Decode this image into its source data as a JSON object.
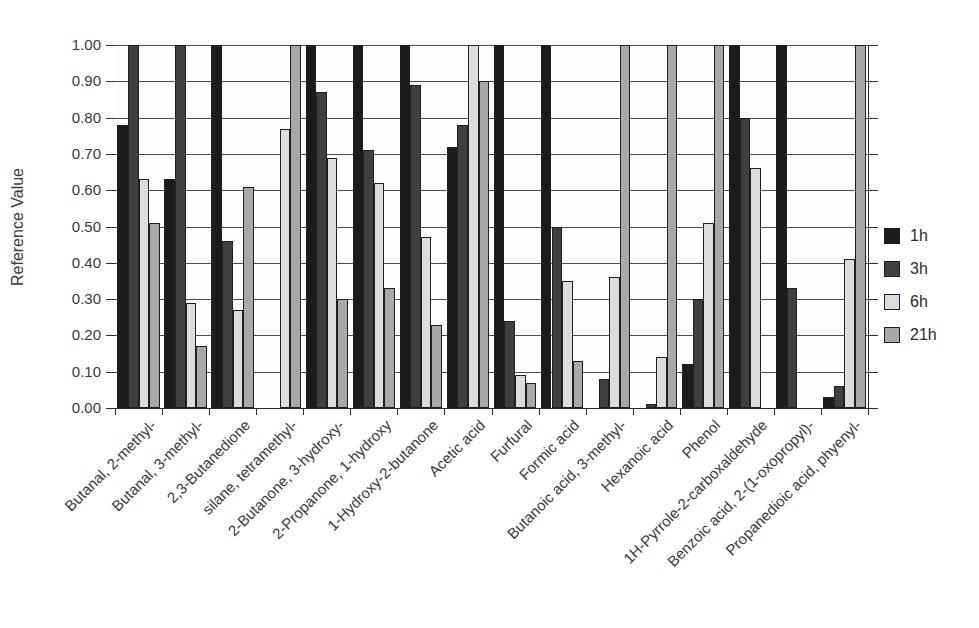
{
  "chart_data": {
    "type": "bar",
    "title": "",
    "xlabel": "",
    "ylabel": "Reference Value",
    "ylim": [
      0.0,
      1.0
    ],
    "ytick_step": 0.1,
    "ytick_decimals": 2,
    "grid": true,
    "legend_position": "right",
    "categories": [
      "Butanal, 2-methyl-",
      "Butanal, 3-methyl-",
      "2,3-Butanedione",
      "silane, tetramethyl-",
      "2-Butanone, 3-hydroxy-",
      "2-Propanone, 1-hydroxy",
      "1-Hydroxy-2-butanone",
      "Acetic acid",
      "Furfural",
      "Formic acid",
      "Butanoic acid, 3-methyl-",
      "Hexanoic acid",
      "Phenol",
      "1H-Pyrrole-2-carboxaldehyde",
      "Benzoic acid, 2-(1-oxopropyl)-",
      "Propanedioic acid, phyenyl-"
    ],
    "series": [
      {
        "name": "1h",
        "color": "#1b1b1b",
        "values": [
          0.78,
          0.63,
          1.0,
          0.0,
          1.0,
          1.0,
          1.0,
          0.72,
          1.0,
          1.0,
          0.0,
          0.0,
          0.12,
          1.0,
          1.0,
          0.03
        ]
      },
      {
        "name": "3h",
        "color": "#3f3f3f",
        "values": [
          1.0,
          1.0,
          0.46,
          0.0,
          0.87,
          0.71,
          0.89,
          0.78,
          0.24,
          0.5,
          0.08,
          0.01,
          0.3,
          0.8,
          0.33,
          0.06
        ]
      },
      {
        "name": "6h",
        "color": "#dcdcdc",
        "values": [
          0.63,
          0.29,
          0.27,
          0.77,
          0.69,
          0.62,
          0.47,
          1.0,
          0.09,
          0.35,
          0.36,
          0.14,
          0.51,
          0.66,
          0.0,
          0.41
        ]
      },
      {
        "name": "21h",
        "color": "#a8a8a8",
        "values": [
          0.51,
          0.17,
          0.61,
          1.0,
          0.3,
          0.33,
          0.23,
          0.9,
          0.07,
          0.13,
          1.0,
          1.0,
          1.0,
          0.0,
          0.0,
          1.0
        ]
      }
    ]
  }
}
